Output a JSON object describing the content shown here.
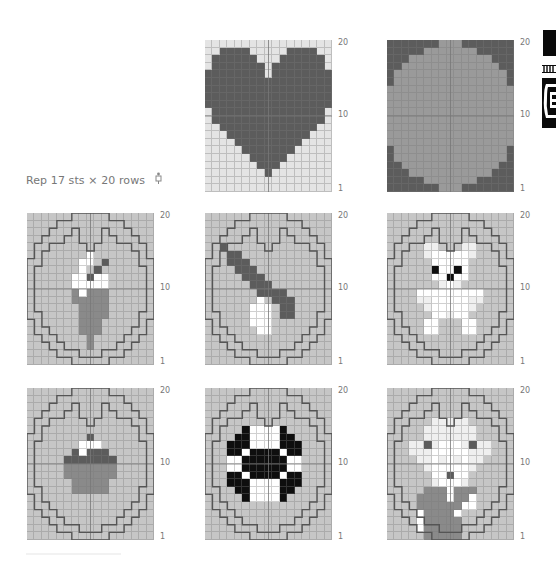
{
  "caption": {
    "repeat_text": "Rep 17 sts × 20 rows",
    "repeat_icon": "needle-symbol-icon"
  },
  "row_labels": {
    "top": "20",
    "middle": "10",
    "bottom": "1"
  },
  "colors": {
    "light": "#e4e4e4",
    "base": "#c6c6c6",
    "dark": "#5c5c5c",
    "medium": "#8a8a8a",
    "white": "#ffffff",
    "black": "#0e0e0e",
    "pale": "#efefef",
    "outline": "#555555"
  },
  "charts": [
    {
      "name": "heart",
      "pos": [
        205,
        40
      ],
      "outline": false,
      "rows": [
        "LLLLLLLLLLLLLLLLL",
        "LLDDDDLLLLLDDDDLL",
        "LDDDDDDLLLDDDDDDL",
        "LDDDDDDDLDDDDDDDL",
        "DDDDDDDDLDDDDDDDD",
        "DDDDDDDDDDDDDDDDD",
        "DDDDDDDDDDDDDDDDD",
        "DDDDDDDDDDDDDDDDD",
        "DDDDDDDDDDDDDDDDD",
        "LDDDDDDDDDDDDDDDL",
        "LDDDDDDDDDDDDDDDL",
        "LLDDDDDDDDDDDDDLL",
        "LLLDDDDDDDDDDDLLL",
        "LLLLDDDDDDDDDLLLL",
        "LLLLLDDDDDDDLLLLL",
        "LLLLLLDDDDDLLLLLL",
        "LLLLLLLDDDLLLLLLL",
        "LLLLLLLLDLLLLLLLL",
        "LLLLLLLLLLLLLLLLL",
        "LLLLLLLLLLLLLLLLL"
      ]
    },
    {
      "name": "oval",
      "pos": [
        387,
        40
      ],
      "outline": false,
      "rows": [
        "DDDDDDDGGGDDDDDDD",
        "DDDDDGGGGGGGDDDDD",
        "DDDGGGGGGGGGGGDDD",
        "DDGGGGGGGGGGGGGDD",
        "DGGGGGGGGGGGGGGGD",
        "DGGGGGGGGGGGGGGGD",
        "GGGGGGGGGGGGGGGGG",
        "GGGGGGGGGGGGGGGGG",
        "GGGGGGGGGGGGGGGGG",
        "GGGGGGGGGGGGGGGGG",
        "GGGGGGGGGGGGGGGGG",
        "GGGGGGGGGGGGGGGGG",
        "GGGGGGGGGGGGGGGGG",
        "GGGGGGGGGGGGGGGGG",
        "DGGGGGGGGGGGGGGGD",
        "DGGGGGGGGGGGGGGGD",
        "DDGGGGGGGGGGGGGDD",
        "DDDGGGGGGGGGGGDDD",
        "DDDDDGGGGGGGDDDDD",
        "DDDDDDDGGGDDDDDDD"
      ]
    },
    {
      "name": "ice-cream",
      "pos": [
        27,
        213
      ],
      "outline": true,
      "rows": [
        "BBBBBBBBBBBBBBBBB",
        "BBBBBBBBBBBBBBBBB",
        "BBBBBBBBBBBBBBBBB",
        "BBBBBBBBBBBBBBBBB",
        "BBBBBBBBBBBBBBBBB",
        "BBBBBBBBWBBBBBBBB",
        "BBBBBBBWWBDBBBBBB",
        "BBBBBBBWBDBBBBBBB",
        "BBBBBBWWDWWBBBBBB",
        "BBBBBBWWWWWBBBBBB",
        "BBBBBBMWMMMBBBBBB",
        "BBBBBBMMMMMBBBBBB",
        "BBBBBBBMMMMBBBBBB",
        "BBBBBBBMMMMBBBBBB",
        "BBBBBBBMMMBBBBBBB",
        "BBBBBBBMMMBBBBBBB",
        "BBBBBBBBMBBBBBBBB",
        "BBBBBBBBMBBBBBBBB",
        "BBBBBBBBBBBBBBBBB",
        "BBBBBBBBBBBBBBBBB"
      ]
    },
    {
      "name": "spoon",
      "pos": [
        205,
        213
      ],
      "outline": true,
      "rows": [
        "BBBBBBBBBBBBBBBBB",
        "BBBBBBBBBBBBBBBBB",
        "BBBBBBBBBBBBBBBBB",
        "BBBBBBBBBBBBBBBBB",
        "BBDBBBBBBBBBBBBBB",
        "BBBDDBBBBBBBBBBBB",
        "BBBDDDBBBBBBBBBBB",
        "BBBBDDDBBBBBBBBBB",
        "BBBBBDDDBBBBBBBBB",
        "BBBBBBDDDBBBBBBBB",
        "BBBBBBBDDDDBBBBBB",
        "BBBBBBBWBDDDBBBBB",
        "BBBBBBWWWBDDBBBBB",
        "BBBBBBWWWBDDBBBBB",
        "BBBBBBWWWBBBBBBBB",
        "BBBBBBBWWBBBBBBBB",
        "BBBBBBBBBBBBBBBBB",
        "BBBBBBBBBBBBBBBBB",
        "BBBBBBBBBBBBBBBBB",
        "BBBBBBBBBBBBBBBBB"
      ]
    },
    {
      "name": "teddy-bear",
      "pos": [
        387,
        213
      ],
      "outline": true,
      "rows": [
        "BBBBBBBBBBBBBBBBB",
        "BBBBBBBBBBBBBBBBB",
        "BBBBBBBBBBBBBBBBB",
        "BBBBBBBBBBBBBBBBB",
        "BBBBBPPBBBPPBBBBB",
        "BBBBBPWWWWWPBBBBB",
        "BBBBBBWWWWWBBBBBB",
        "BBBBBBKWWKWBBBBBB",
        "BBBBBBWWKWWBBBBBB",
        "BBBBBBBPWPBBBBBBB",
        "BBBBWWWWWWWWWBBBB",
        "BBBBPPWWWWWPPBBBB",
        "BBBBBPWWWWWPBBBBB",
        "BBBBBBWWPWWBBBBBB",
        "BBBBBWWBBBWWBBBBB",
        "BBBBBWWBBBWWBBBBB",
        "BBBBBBBBBBBBBBBBB",
        "BBBBBBBBBBBBBBBBB",
        "BBBBBBBBBBBBBBBBB",
        "BBBBBBBBBBBBBBBBB"
      ]
    },
    {
      "name": "cupcake",
      "pos": [
        27,
        388
      ],
      "outline": true,
      "rows": [
        "BBBBBBBBBBBBBBBBB",
        "BBBBBBBBBBBBBBBBB",
        "BBBBBBBBBBBBBBBBB",
        "BBBBBBBBBBBBBBBBB",
        "BBBBBBBBBBBBBBBBB",
        "BBBBBBBBBBBBBBBBB",
        "BBBBBBBBDBBBBBBBB",
        "BBBBBBBWWWBBBBBBB",
        "BBBBBBDWDDDBBBBBB",
        "BBBBBDDDDDDDBBBBB",
        "BBBBBMMMMMMMBBBBB",
        "BBBBBMMMMMMMBBBBB",
        "BBBBBBMMMMMBBBBBB",
        "BBBBBBMMMMMBBBBBB",
        "BBBBBBBBBBBBBBBBB",
        "BBBBBBBBBBBBBBBBB",
        "BBBBBBBBBBBBBBBBB",
        "BBBBBBBBBBBBBBBBB",
        "BBBBBBBBBBBBBBBBB",
        "BBBBBBBBBBBBBBBBB"
      ]
    },
    {
      "name": "football",
      "pos": [
        205,
        388
      ],
      "outline": true,
      "rows": [
        "BBBBBBBBBBBBBBBBB",
        "BBBBBBBBBBBBBBBBB",
        "BBBBBBBBBBBBBBBBB",
        "BBBBBBBBBBBBBBBBB",
        "BBBBBBBBBBBBBBBBB",
        "BBBBBKWWWWKBBBBBB",
        "BBBBKKWWWWKKBBBBB",
        "BBBKKKWWWWKKKBBBB",
        "BBBKKWKKKKWKKBBBB",
        "BBBWWKKKKKKWWBBBB",
        "BBBWWKKKKKKWWBBBB",
        "BBBKKWKKKKWKKBBBB",
        "BBBKKKWWWWKKKBBBB",
        "BBBBKKWWWWKKBBBBB",
        "BBBBBKWWWWKBBBBBB",
        "BBBBBBBBBBBBBBBBB",
        "BBBBBBBBBBBBBBBBB",
        "BBBBBBBBBBBBBBBBB",
        "BBBBBBBBBBBBBBBBB",
        "BBBBBBBBBBBBBBBBB"
      ]
    },
    {
      "name": "grandpa-portrait",
      "pos": [
        387,
        388
      ],
      "outline": true,
      "rows": [
        "BBBBBBBBBBBBBBBBB",
        "BBBBBBBBBBBBBBBBB",
        "BBBBBBBBBBBBBBBBB",
        "BBBBBBBBBBBBBBBBB",
        "BBBBBBPPPPPBBBBBB",
        "BBBBBPPPPPPPBBBBB",
        "BBBBBPPPPPPPBBBBB",
        "BBBPPDPWWWPDPPBBB",
        "BBBPPPWWWWWPPPBBB",
        "BBBBPPWPWPWPPBBBB",
        "BBBBBPWWWWWPBBBBB",
        "BBBBBBWWDWWBBBBBB",
        "BBBBBBPWWWPBBBBBB",
        "BBBBBMMMWMMMBBBBB",
        "BBBBMMMMWMMWBBBBB",
        "BBBBMMMMMMWWBBBBB",
        "BBBBWMMMMWBBBBBBB",
        "BBBBWMMMMMBBBBBBB",
        "BBBBWMMMMMBBBBBBB",
        "BBBBBMMMMMBBBBBBB"
      ]
    }
  ],
  "outline_path": "M 0 1 L 0 1",
  "side_icons": [
    {
      "name": "chart-symbol-block-icon",
      "pos": [
        543,
        30
      ],
      "size": [
        13,
        26
      ]
    },
    {
      "name": "chart-symbol-stripes-icon",
      "pos": [
        543,
        60
      ],
      "size": [
        13,
        5
      ]
    },
    {
      "name": "chart-symbol-ornament-icon",
      "pos": [
        543,
        80
      ],
      "size": [
        13,
        48
      ]
    }
  ]
}
